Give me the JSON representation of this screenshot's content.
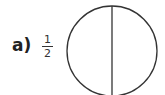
{
  "problem": {
    "label": "a)",
    "fraction": {
      "numerator": "1",
      "denominator": "2"
    }
  },
  "figure": {
    "shape": "circle",
    "parts": 2,
    "divider": "vertical",
    "stroke_color": "#333333"
  }
}
